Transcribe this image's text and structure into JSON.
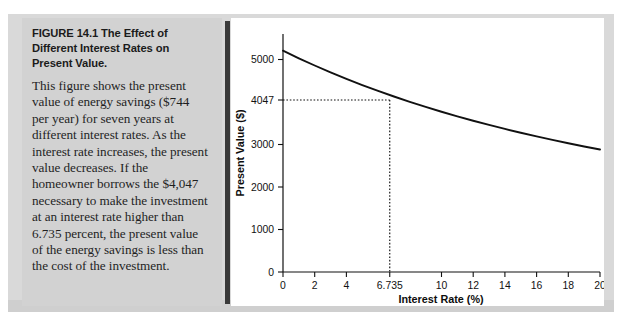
{
  "figure": {
    "title_number": "FIGURE 14.1",
    "title_text": "The Effect of Different Interest Rates on Present Value.",
    "body_text": "This figure shows the present value of energy savings ($744 per year) for seven years at different interest rates. As the interest rate increases, the present value decreases. If the homeowner borrows the $4,047 necessary to make the investment at an interest rate higher than 6.735 percent, the present value of the energy savings is less than the cost of the investment."
  },
  "chart_data": {
    "type": "line",
    "title": "",
    "xlabel": "Interest Rate (%)",
    "ylabel": "Present Value ($)",
    "xlim": [
      0,
      20
    ],
    "ylim": [
      0,
      5600
    ],
    "grid": false,
    "legend": false,
    "x_ticks": [
      0,
      2,
      4,
      6.735,
      10,
      12,
      14,
      16,
      18,
      20
    ],
    "x_tick_labels": [
      "0",
      "2",
      "4",
      "6.735",
      "10",
      "12",
      "14",
      "16",
      "18",
      "20"
    ],
    "y_ticks": [
      0,
      1000,
      2000,
      3000,
      4047,
      5000
    ],
    "y_tick_labels": [
      "0",
      "1000",
      "2000",
      "3000",
      "4047",
      "5000"
    ],
    "series": [
      {
        "name": "Present Value of Energy Savings",
        "x": [
          0,
          1,
          2,
          3,
          4,
          5,
          6,
          6.735,
          7,
          8,
          9,
          10,
          11,
          12,
          13,
          14,
          15,
          16,
          17,
          18,
          19,
          20
        ],
        "values": [
          5208,
          5029,
          4859,
          4698,
          4545,
          4399,
          4261,
          4047,
          4129,
          4004,
          3884,
          3771,
          3662,
          3559,
          3460,
          3366,
          3276,
          3190,
          3108,
          3029,
          2954,
          2882
        ]
      }
    ],
    "annotations": [
      {
        "name": "breakeven-guide",
        "x": 6.735,
        "y": 4047,
        "label_x": "6.735",
        "label_y": "4047",
        "style": "dotted-crosshair"
      }
    ]
  },
  "colors": {
    "curve": "#111111",
    "axis": "#111111",
    "caption_panel": "#d2d2d2",
    "backdrop": "#d9d9d9",
    "divider": "#3a3a3a",
    "chart_panel": "#ffffff"
  }
}
